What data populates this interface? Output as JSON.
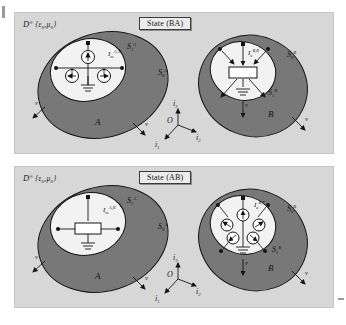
{
  "figure": {
    "background": "#ffffff",
    "panel_bg": "#d7d7d7",
    "outer_region_fill": "#787878",
    "inner_region_fill": "#f2f2f2",
    "stroke": "#141414"
  },
  "panels": [
    {
      "id": "top",
      "domain_label": "ᴰ∞{ε₀,μ₀}",
      "domain_label_main": "D",
      "domain_label_sup": "∞",
      "domain_label_args": "{ε₀,μ₀}",
      "state_label": "State (BA)",
      "left": {
        "region_label": "A",
        "outer_surface": "S",
        "outer_surface_sub": "0",
        "outer_surface_sup": "A",
        "inner_surface": "S",
        "inner_surface_sub": "1",
        "inner_surface_sup": "A",
        "source_label": "I",
        "source_sub": "m",
        "source_sup": "A,T",
        "source_kind": "circular-sources",
        "source_count": 3,
        "ground": "ground-symbol",
        "normals": [
          "ν",
          "ν"
        ]
      },
      "right": {
        "region_label": "B",
        "outer_surface": "S",
        "outer_surface_sub": "0",
        "outer_surface_sup": "B",
        "inner_surface": "S",
        "inner_surface_sub": "1",
        "inner_surface_sup": "B",
        "source_label": "I",
        "source_sub": "e",
        "source_sup": "B,R",
        "source_kind": "box-receiver",
        "ground": "ground-symbol",
        "normals": [
          "ν",
          "ν"
        ]
      }
    },
    {
      "id": "bottom",
      "domain_label_main": "D",
      "domain_label_sup": "∞",
      "domain_label_args": "{ε₀,μ₀}",
      "state_label": "State (AB)",
      "left": {
        "region_label": "A",
        "outer_surface": "S",
        "outer_surface_sub": "0",
        "outer_surface_sup": "A",
        "inner_surface": "S",
        "inner_surface_sub": "1",
        "inner_surface_sup": "A",
        "source_label": "I",
        "source_sub": "m",
        "source_sup": "A,R",
        "source_kind": "box-receiver",
        "ground": "ground-symbol",
        "normals": [
          "ν",
          "ν"
        ]
      },
      "right": {
        "region_label": "B",
        "outer_surface": "S",
        "outer_surface_sub": "0",
        "outer_surface_sup": "B",
        "inner_surface": "S",
        "inner_surface_sub": "1",
        "inner_surface_sup": "B",
        "source_label": "I",
        "source_sub": "e",
        "source_sup": "B,T",
        "source_kind": "circular-sources",
        "source_count": 5,
        "ground": "ground-symbol",
        "normals": [
          "ν",
          "ν"
        ]
      }
    }
  ],
  "axes": {
    "origin": "O",
    "up": "i",
    "up_sub": "3",
    "right": "i",
    "right_sub": "2",
    "front": "i",
    "front_sub": "1"
  }
}
